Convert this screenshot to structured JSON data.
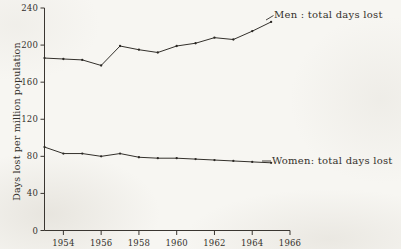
{
  "figure": {
    "background_color": "#f7f6f2",
    "ink_color": "#33302b",
    "y_axis_title": "Days lost per million population"
  },
  "annotations": {
    "men": "Men : total days lost",
    "women": "Women: total days lost"
  },
  "chart_data": {
    "type": "line",
    "title": "",
    "subtitle": "",
    "xlabel": "",
    "ylabel": "Days lost per million population",
    "xlim": [
      1953,
      1966
    ],
    "ylim": [
      0,
      240
    ],
    "xticks": [
      1954,
      1956,
      1958,
      1960,
      1962,
      1964,
      1966
    ],
    "xtick_labels": [
      "1954",
      "1956",
      "1958",
      "1960",
      "1962",
      "1964",
      "1966"
    ],
    "yticks": [
      0,
      40,
      80,
      120,
      160,
      200,
      240
    ],
    "ytick_labels": [
      "0",
      "40",
      "80",
      "120",
      "160",
      "200",
      "240"
    ],
    "grid": false,
    "legend": "inline-annotations",
    "x": [
      1953,
      1954,
      1955,
      1956,
      1957,
      1958,
      1959,
      1960,
      1961,
      1962,
      1963,
      1964,
      1965
    ],
    "series": [
      {
        "name": "Men : total days lost",
        "label_position": "right-of-line-end",
        "values": [
          186,
          185,
          184,
          178,
          199,
          195,
          192,
          199,
          202,
          208,
          206,
          215,
          225
        ]
      },
      {
        "name": "Women: total days lost",
        "label_position": "right-of-line-end",
        "values": [
          90,
          83,
          83,
          80,
          83,
          79,
          78,
          78,
          77,
          76,
          75,
          74,
          73
        ]
      }
    ]
  }
}
